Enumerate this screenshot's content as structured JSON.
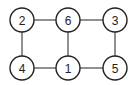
{
  "diagram": {
    "type": "undirected-graph",
    "nodes": [
      {
        "id": "2",
        "label": "2",
        "x": 22,
        "y": 20
      },
      {
        "id": "6",
        "label": "6",
        "x": 68,
        "y": 20
      },
      {
        "id": "3",
        "label": "3",
        "x": 115,
        "y": 20
      },
      {
        "id": "4",
        "label": "4",
        "x": 22,
        "y": 68
      },
      {
        "id": "1",
        "label": "1",
        "x": 68,
        "y": 68
      },
      {
        "id": "5",
        "label": "5",
        "x": 115,
        "y": 68
      }
    ],
    "edges": [
      {
        "from": "2",
        "to": "6"
      },
      {
        "from": "6",
        "to": "3"
      },
      {
        "from": "2",
        "to": "4"
      },
      {
        "from": "6",
        "to": "1"
      },
      {
        "from": "3",
        "to": "5"
      },
      {
        "from": "4",
        "to": "1"
      },
      {
        "from": "1",
        "to": "5"
      }
    ],
    "node_radius": 12,
    "stroke_color": "#222222",
    "fill_color": "#ffffff"
  }
}
